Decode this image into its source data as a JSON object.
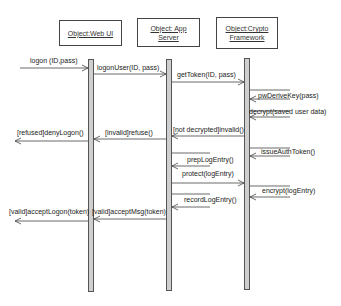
{
  "objects": [
    {
      "id": "web-ui",
      "label": "Object:Web UI"
    },
    {
      "id": "app-server",
      "label": "Object: App Server"
    },
    {
      "id": "crypto",
      "label": "Object:Crypto Framework"
    }
  ],
  "messages": [
    {
      "label": "logon (ID,pass)",
      "from": "external",
      "to": "web-ui",
      "kind": "call"
    },
    {
      "label": "logonUser(ID, pass)",
      "from": "web-ui",
      "to": "app-server",
      "kind": "call"
    },
    {
      "label": "getToken(ID, pass)",
      "from": "app-server",
      "to": "crypto",
      "kind": "call"
    },
    {
      "label": "pwDeriveKey(pass)",
      "from": "crypto",
      "to": "crypto",
      "kind": "self"
    },
    {
      "label": "decrypt(saved user data)",
      "from": "crypto",
      "to": "crypto",
      "kind": "self"
    },
    {
      "label": "[not decrypted]invalid()",
      "from": "crypto",
      "to": "app-server",
      "kind": "return"
    },
    {
      "label": "[invalid]refuse()",
      "from": "app-server",
      "to": "web-ui",
      "kind": "return"
    },
    {
      "label": "[refused]denyLogon()",
      "from": "web-ui",
      "to": "external",
      "kind": "return"
    },
    {
      "label": "issueAuthToken()",
      "from": "crypto",
      "to": "crypto",
      "kind": "self"
    },
    {
      "label": "prepLogEntry()",
      "from": "app-server",
      "to": "app-server",
      "kind": "self"
    },
    {
      "label": "protect(logEntry)",
      "from": "app-server",
      "to": "crypto",
      "kind": "call"
    },
    {
      "label": "encrypt(logEntry)",
      "from": "crypto",
      "to": "crypto",
      "kind": "self"
    },
    {
      "label": "recordLogEntry()",
      "from": "app-server",
      "to": "app-server",
      "kind": "self"
    },
    {
      "label": "[valid]acceptMsg(token)",
      "from": "app-server",
      "to": "web-ui",
      "kind": "return"
    },
    {
      "label": "[valid]acceptLogon(token)",
      "from": "web-ui",
      "to": "external",
      "kind": "return"
    }
  ],
  "colors": {
    "line": "#444444",
    "activation_fill": "#cfcfcf",
    "background": "#ffffff"
  }
}
